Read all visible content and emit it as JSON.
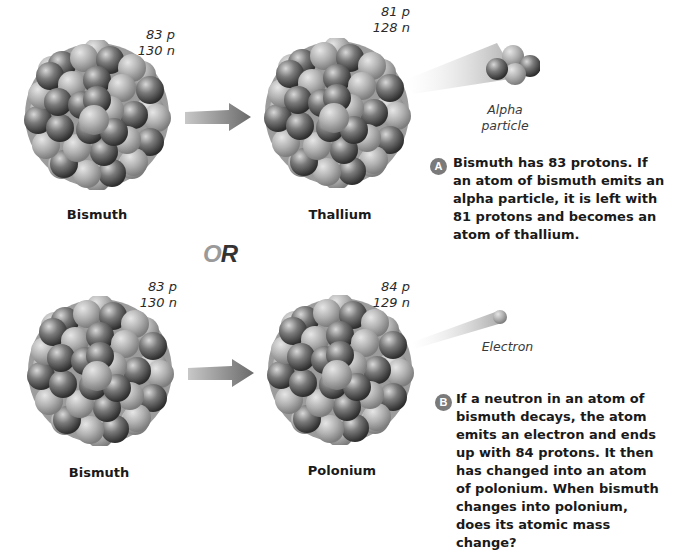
{
  "panel_a": {
    "reactant": {
      "name": "Bismuth",
      "protons": "83 p",
      "neutrons": "130 n"
    },
    "product": {
      "name": "Thallium",
      "protons": "81 p",
      "neutrons": "128 n"
    },
    "emitted": {
      "label_line1": "Alpha",
      "label_line2": "particle"
    },
    "badge": "A",
    "caption": "Bismuth has 83 protons. If an atom of bismuth emits an alpha particle, it is left with 81 protons and becomes an atom of thallium."
  },
  "separator": {
    "or_first": "O",
    "or_second": "R"
  },
  "panel_b": {
    "reactant": {
      "name": "Bismuth",
      "protons": "83 p",
      "neutrons": "130 n"
    },
    "product": {
      "name": "Polonium",
      "protons": "84 p",
      "neutrons": "129 n"
    },
    "emitted": {
      "label": "Electron"
    },
    "badge": "B",
    "caption": "If a neutron in an atom of bismuth decays, the atom emits an electron and ends up with 84 protons. It then has changed into an atom of polonium. When bismuth changes into polonium, does its atomic mass change?"
  },
  "colors": {
    "proton_dark": "#555555",
    "neutron_light": "#aaaaaa",
    "arrow": "#7d7d7d",
    "badge": "#7a7a7a"
  }
}
